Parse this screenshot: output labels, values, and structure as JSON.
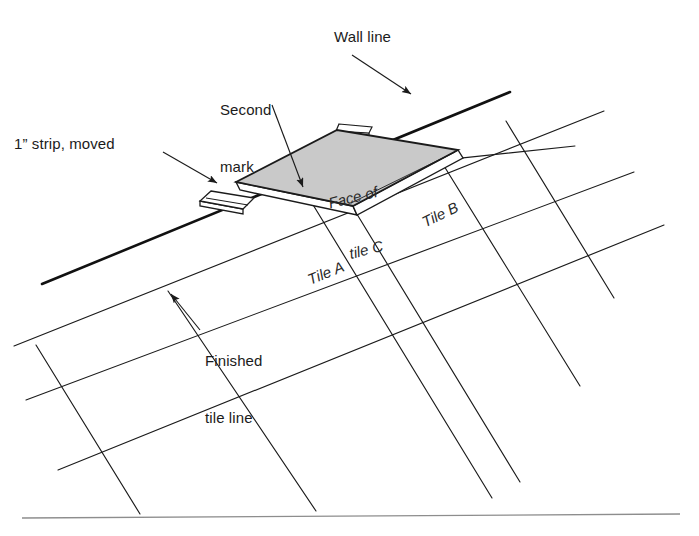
{
  "figure": {
    "background_color": "#ffffff",
    "line_color": "#1b1b1b",
    "tile_fill_color": "#c9c9c9",
    "rule_color": "#8d8d8d"
  },
  "callouts": {
    "wall_line": {
      "label": "Wall line",
      "x": 334,
      "y": 28,
      "arrow_from": [
        352,
        55
      ],
      "arrow_to": [
        413,
        96
      ]
    },
    "second_mark": {
      "label_line1": "Second",
      "label_line2": "mark",
      "x": 220,
      "y": 62,
      "arrow_from": [
        272,
        105
      ],
      "arrow_to": [
        304,
        189
      ]
    },
    "strip_moved": {
      "label": "1” strip, moved",
      "x": 14,
      "y": 135,
      "arrow_from": [
        163,
        152
      ],
      "arrow_to": [
        219,
        184
      ]
    },
    "finished_tile_line": {
      "label_line1": "Finished",
      "label_line2": "tile line",
      "x": 205,
      "y": 313,
      "arrow_from": [
        200,
        330
      ],
      "arrow_to": [
        169,
        292
      ]
    }
  },
  "tile_labels": [
    {
      "name": "tile-a-label",
      "text_plain": "Tile ",
      "text_italic": "A",
      "x": 305,
      "y": 272,
      "rotation": -22
    },
    {
      "name": "tile-b-label",
      "text_plain": "Tile ",
      "text_italic": "B",
      "x": 419,
      "y": 215,
      "rotation": -26
    },
    {
      "name": "tile-c-label",
      "text_line1": "Face of",
      "text_line2": "tile C",
      "x": 318,
      "y": 160,
      "rotation": -14
    }
  ],
  "shapes": {
    "tile_c_face": {
      "name": "tile-c-face",
      "points": "236,182 337,130 458,150 353,206",
      "fill": "#c9c9c9"
    },
    "tile_c_thickness_right": {
      "name": "tile-c-edge-right",
      "points": "458,150 462,157 357,214 353,206"
    },
    "tile_c_thickness_left": {
      "name": "tile-c-edge-left",
      "points": "236,182 240,189 357,214 353,206"
    },
    "wall_line": {
      "name": "wall-line",
      "from": [
        42,
        284
      ],
      "to": [
        510,
        92
      ]
    },
    "bottom_rule": {
      "name": "bottom-rule",
      "from": [
        22,
        518
      ],
      "to": [
        680,
        514
      ]
    },
    "strip_left": {
      "name": "strip-one-inch-moved",
      "top_face": "211,191 254,198 243,209 200,201",
      "side_face": "200,201 243,209 243,214 200,206"
    },
    "strip_top": {
      "name": "strip-top-tab",
      "top_face": "339,124 372,127 369,133 336,131",
      "side_face": "336,131 369,133 369,137 336,135"
    }
  },
  "grid": {
    "description": "Perspective floor tile joint lines",
    "lines_family_a": [
      {
        "name": "tile-line-a1",
        "from": [
          14,
          346
        ],
        "to": [
          604,
          111
        ]
      },
      {
        "name": "tile-line-a2",
        "from": [
          26,
          400
        ],
        "to": [
          634,
          172
        ]
      },
      {
        "name": "tile-line-a3",
        "from": [
          58,
          470
        ],
        "to": [
          664,
          225
        ]
      },
      {
        "name": "tile-line-a4",
        "from": [
          236,
          182
        ],
        "to": [
          575,
          146
        ]
      }
    ],
    "lines_family_b": [
      {
        "name": "tile-line-b1",
        "from": [
          36,
          345
        ],
        "to": [
          140,
          514
        ]
      },
      {
        "name": "tile-line-b2",
        "from": [
          168,
          291
        ],
        "to": [
          316,
          511
        ]
      },
      {
        "name": "tile-line-b3",
        "from": [
          304,
          190
        ],
        "to": [
          492,
          498
        ]
      },
      {
        "name": "tile-line-b4",
        "from": [
          436,
          153
        ],
        "to": [
          580,
          386
        ]
      },
      {
        "name": "tile-line-b5",
        "from": [
          506,
          121
        ],
        "to": [
          614,
          298
        ]
      },
      {
        "name": "tile-line-b6",
        "from": [
          352,
          206
        ],
        "to": [
          520,
          482
        ]
      }
    ]
  }
}
